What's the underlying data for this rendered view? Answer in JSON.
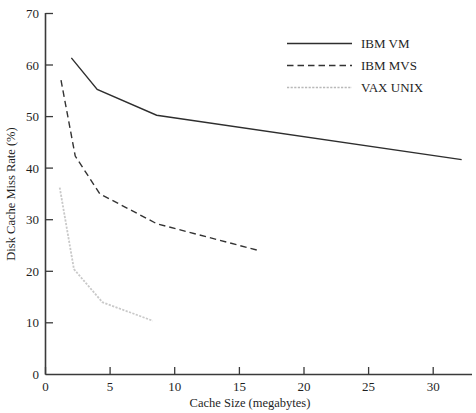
{
  "chart_data": {
    "type": "line",
    "title": "",
    "xlabel": "Cache Size (megabytes)",
    "ylabel": "Disk Cache Miss Rate (%)",
    "xlim": [
      0,
      33
    ],
    "ylim": [
      0,
      70
    ],
    "grid": false,
    "legend_position": "top-right",
    "xticks": [
      0,
      5,
      10,
      15,
      20,
      25,
      30
    ],
    "xtick_labels": [
      "0",
      "5",
      "10",
      "15",
      "20",
      "25",
      "30"
    ],
    "yticks": [
      0,
      10,
      20,
      30,
      40,
      50,
      60,
      70
    ],
    "ytick_labels": [
      "0",
      "10",
      "20",
      "30",
      "40",
      "50",
      "60",
      "70"
    ],
    "series": [
      {
        "name": "IBM VM",
        "style": "solid",
        "color": "#2e2e2e",
        "x": [
          2.0,
          4.0,
          8.6,
          32.2
        ],
        "y": [
          61.3,
          55.2,
          50.2,
          41.6
        ]
      },
      {
        "name": "IBM MVS",
        "style": "dashed",
        "color": "#333333",
        "x": [
          1.2,
          2.3,
          4.2,
          8.6,
          16.5
        ],
        "y": [
          57.0,
          42.3,
          35.0,
          29.2,
          24.0
        ]
      },
      {
        "name": "VAX UNIX",
        "style": "dotted",
        "color": "#c9c9c9",
        "x": [
          1.1,
          2.2,
          4.4,
          8.3
        ],
        "y": [
          36.2,
          20.4,
          14.0,
          10.4
        ]
      }
    ]
  },
  "legend": {
    "entries": [
      {
        "label": "IBM VM"
      },
      {
        "label": "IBM MVS"
      },
      {
        "label": "VAX UNIX"
      }
    ]
  }
}
